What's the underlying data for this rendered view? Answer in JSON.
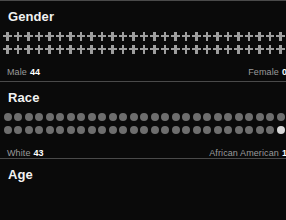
{
  "theme": {
    "background": "#0a0a0a",
    "divider": "#4a4a4a",
    "heading_color": "#f2f2f2",
    "label_color": "#9a9a9a",
    "value_color": "#ffffff",
    "glyph_primary": "#9e9e9e",
    "glyph_secondary": "#e8e8e8",
    "dot_primary": "#6e6e6e",
    "dot_secondary": "#d8d8d8"
  },
  "sections": [
    {
      "heading": "Gender",
      "glyph": "cross-icon",
      "rows": 2,
      "per_row": 27,
      "highlight_count": 0,
      "legend_left_label": "Male",
      "legend_left_value": "44",
      "legend_right_label": "Female",
      "legend_right_value": "0"
    },
    {
      "heading": "Race",
      "glyph": "circle-icon",
      "rows": 2,
      "per_row": 27,
      "highlight_count": 1,
      "legend_left_label": "White",
      "legend_left_value": "43",
      "legend_right_label": "African American",
      "legend_right_value": "1"
    },
    {
      "heading": "Age",
      "glyph": "none",
      "rows": 0,
      "per_row": 0,
      "highlight_count": 0,
      "legend_left_label": "",
      "legend_left_value": "",
      "legend_right_label": "",
      "legend_right_value": ""
    }
  ],
  "chart_data": {
    "type": "bar",
    "subtitle": "",
    "xlabel": "",
    "ylabel": "",
    "charts": [
      {
        "title": "Gender",
        "categories": [
          "Male",
          "Female"
        ],
        "values": [
          44,
          0
        ],
        "unit": "people",
        "icon": "cross"
      },
      {
        "title": "Race",
        "categories": [
          "White",
          "African American"
        ],
        "values": [
          43,
          1
        ],
        "unit": "people",
        "icon": "circle"
      },
      {
        "title": "Age",
        "categories": [],
        "values": [],
        "unit": "people",
        "icon": ""
      }
    ],
    "legend": "bottom",
    "grid": false
  }
}
